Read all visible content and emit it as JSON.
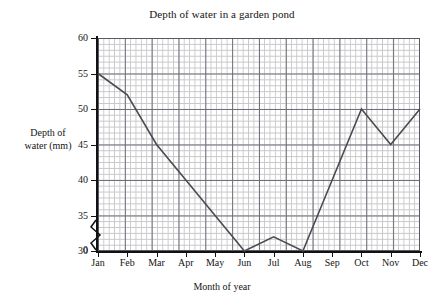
{
  "chart_data": {
    "type": "line",
    "title": "Depth of water in a garden pond",
    "xlabel": "Month of year",
    "ylabel": "Depth of water (mm)",
    "ylabel_line1": "Depth of",
    "ylabel_line2": "water (mm)",
    "categories": [
      "Jan",
      "Feb",
      "Mar",
      "Apr",
      "May",
      "Jun",
      "Jul",
      "Aug",
      "Sep",
      "Oct",
      "Nov",
      "Dec"
    ],
    "values": [
      55,
      52,
      45,
      40,
      35,
      30,
      32,
      30,
      40,
      50,
      45,
      50
    ],
    "series": [
      {
        "name": "Depth of water (mm)",
        "values": [
          55,
          52,
          45,
          40,
          35,
          30,
          32,
          30,
          40,
          50,
          45,
          50
        ]
      }
    ],
    "ylim": [
      30,
      60
    ],
    "yticks": [
      30,
      35,
      40,
      45,
      50,
      55,
      60
    ],
    "ytick_labels": [
      "30",
      "35",
      "40",
      "45",
      "50",
      "55",
      "60"
    ],
    "zero_label": "0",
    "axis_break": true,
    "axis_break_note": "zigzag break on y-axis between 0 and 30",
    "grid": true,
    "grid_minor": true,
    "minor_per_major": 5,
    "legend": false,
    "line_color": "#4a4a52",
    "grid_major_color": "#6e6e7a",
    "grid_minor_color": "#c8c8c8",
    "axis_color": "#111111"
  }
}
